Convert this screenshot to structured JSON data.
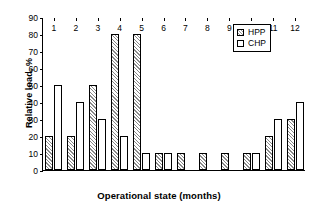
{
  "chart_data": {
    "type": "bar",
    "title": "",
    "xlabel": "Operational state (months)",
    "ylabel": "Relative load, %",
    "categories": [
      "1",
      "2",
      "3",
      "4",
      "5",
      "6",
      "7",
      "8",
      "9",
      "10",
      "11",
      "12"
    ],
    "series": [
      {
        "name": "HPP",
        "values": [
          20,
          20,
          50,
          80,
          80,
          10,
          10,
          10,
          10,
          10,
          20,
          30
        ]
      },
      {
        "name": "CHP",
        "values": [
          50,
          40,
          30,
          20,
          10,
          10,
          0,
          0,
          0,
          10,
          30,
          40
        ]
      }
    ],
    "ylim": [
      0,
      90
    ],
    "yticks": [
      "0",
      "10",
      "20",
      "30",
      "40",
      "50",
      "60",
      "70",
      "80",
      "90"
    ],
    "grid": false,
    "legend_position": "top-right",
    "legend": [
      "HPP",
      "CHP"
    ],
    "colors": {
      "hpp_fill": "#ffffff",
      "hpp_hatch": "#8a8a8a",
      "chp_fill": "#ffffff",
      "outline": "#000000",
      "background": "#ffffff"
    }
  },
  "legend": {
    "items": [
      {
        "label": "HPP",
        "swatch": "hatched-square-swatch"
      },
      {
        "label": "CHP",
        "swatch": "white-square-swatch"
      }
    ]
  }
}
